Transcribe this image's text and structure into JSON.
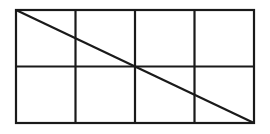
{
  "diagram": {
    "rows": 2,
    "columns": 4,
    "rect": {
      "x": 16,
      "y": 10,
      "width": 238,
      "height": 113
    },
    "stroke_color": "#1a1a1a",
    "background_color": "#ffffff",
    "diagonal": {
      "from": "top-left",
      "to": "bottom-right"
    }
  }
}
